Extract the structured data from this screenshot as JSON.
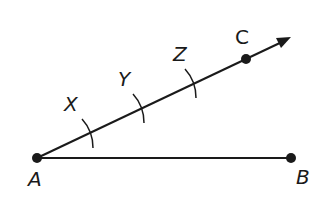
{
  "diagram": {
    "type": "geometric-construction",
    "stroke_color": "#1a1a1a",
    "points": {
      "A": {
        "label": "A",
        "x": 37,
        "y": 158
      },
      "B": {
        "label": "B",
        "x": 291,
        "y": 158
      },
      "C": {
        "label": "C",
        "x": 246,
        "y": 59
      }
    },
    "ray": {
      "from": "A",
      "through": "C",
      "tip": {
        "x": 289,
        "y": 38
      }
    },
    "segment": {
      "from": "A",
      "to": "B"
    },
    "arc_marks": [
      {
        "label": "X",
        "x": 89,
        "y": 133
      },
      {
        "label": "Y",
        "x": 140,
        "y": 108
      },
      {
        "label": "Z",
        "x": 192,
        "y": 83
      }
    ],
    "labels": {
      "A": "A",
      "B": "B",
      "C": "C",
      "X": "X",
      "Y": "Y",
      "Z": "Z"
    }
  }
}
